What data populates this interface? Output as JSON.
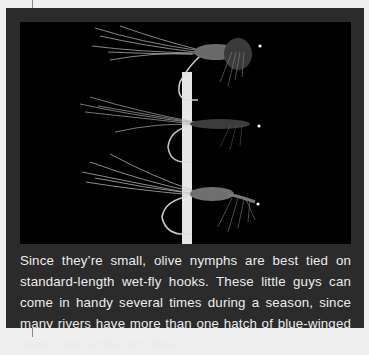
{
  "figure": {
    "photo": {
      "subject": "three olive nymph flies on hooks held by a white vertical stick",
      "background_color": "#000000",
      "flies": [
        {
          "position": "top"
        },
        {
          "position": "middle"
        },
        {
          "position": "bottom"
        }
      ]
    },
    "caption": "Since they’re small, olive nymphs are best tied on standard-length wet-fly hooks. These little guys can come in handy sev­eral times during a season, since many rivers have more than one hatch of blue-winged olives and similar mayflies."
  },
  "colors": {
    "page_background": "#efefef",
    "frame": "#2b2b2b",
    "caption_text": "#ececec"
  }
}
